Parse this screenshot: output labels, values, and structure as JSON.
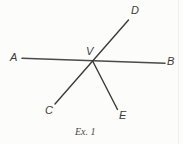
{
  "figure": {
    "caption": "Ex. 1",
    "background_color": "#fcfcfa",
    "line_color_horizontal": "#4a4a4a",
    "line_color_diagonal": "#3a3a3a",
    "label_color": "#3b3b3b",
    "caption_color": "#4a4a48",
    "vertex_name": "V",
    "labels": {
      "a": "A",
      "b": "B",
      "c": "C",
      "d": "D",
      "e": "E",
      "v": "V"
    },
    "points": {
      "A": {
        "x": 22,
        "y": 58
      },
      "B": {
        "x": 165,
        "y": 63
      },
      "C": {
        "x": 55,
        "y": 104
      },
      "D": {
        "x": 128,
        "y": 20
      },
      "E": {
        "x": 117,
        "y": 109
      },
      "V": {
        "x": 93,
        "y": 61
      }
    },
    "rays": [
      {
        "name": "line-ab",
        "from": "A",
        "to": "B"
      },
      {
        "name": "line-cd",
        "from": "C",
        "to": "D"
      },
      {
        "name": "ray-ve",
        "from": "V",
        "to": "E"
      }
    ]
  }
}
